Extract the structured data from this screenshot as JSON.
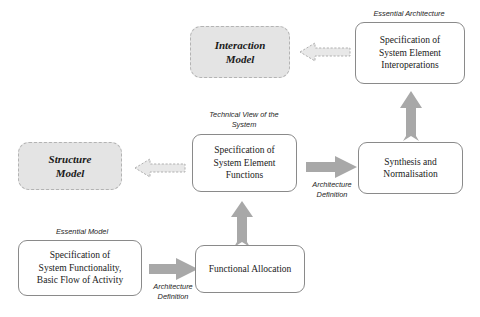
{
  "diagram": {
    "title_present": false,
    "background": "#ffffff",
    "arrow_fill_solid": "#a8a8a8",
    "arrow_fill_dashed": "#e8e8e8",
    "model_box_fill": "#e4e4e4",
    "box_border": "#8a8a8a",
    "nodes": {
      "interaction_model": "Interaction\nModel",
      "structure_model": "Structure\nModel",
      "spec_interoperations": "Specification of\nSystem Element\nInteroperations",
      "spec_functions": "Specification of\nSystem Element\nFunctions",
      "synthesis": "Synthesis and\nNormalisation",
      "spec_functionality": "Specification of\nSystem Functionality,\nBasic Flow of Activity",
      "functional_allocation": "Functional Allocation"
    },
    "captions": {
      "essential_architecture": "Essential Architecture",
      "technical_view": "Technical View of the\nSystem",
      "essential_model": "Essential Model",
      "architecture_definition_middle": "Architecture\nDefinition",
      "architecture_definition_bottom": "Architecture\nDefinition"
    },
    "arrows": {
      "interoperations_to_interaction": "dashed-left-arrow",
      "functions_to_structure": "dashed-left-arrow",
      "synthesis_to_interoperations": "solid-up-arrow",
      "functions_to_synthesis": "solid-right-arrow",
      "allocation_to_functions": "solid-up-arrow",
      "functionality_to_allocation": "solid-right-arrow"
    }
  }
}
